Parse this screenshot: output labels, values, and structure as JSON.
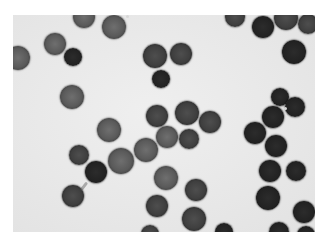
{
  "image": {
    "description": "Grayscale light micrograph of red blood cells on a pale background",
    "width": 328,
    "height": 245,
    "photo_region": {
      "x": 13,
      "y": 15,
      "w": 302,
      "h": 217
    },
    "colors": {
      "margin": "#ffffff",
      "background": "#e8e8e8",
      "cell_light": "#5a5a5a",
      "cell_mid": "#3f3f3f",
      "cell_dark": "#222222"
    }
  },
  "cells": [
    {
      "cx": 84,
      "cy": 17,
      "r": 11,
      "tone": "light"
    },
    {
      "cx": 114,
      "cy": 27,
      "r": 12,
      "tone": "light"
    },
    {
      "cx": 55,
      "cy": 44,
      "r": 11,
      "tone": "light"
    },
    {
      "cx": 73,
      "cy": 57,
      "r": 9,
      "tone": "dark"
    },
    {
      "cx": 18,
      "cy": 58,
      "r": 12,
      "tone": "light"
    },
    {
      "cx": 155,
      "cy": 56,
      "r": 12,
      "tone": "mid"
    },
    {
      "cx": 181,
      "cy": 54,
      "r": 11,
      "tone": "mid"
    },
    {
      "cx": 161,
      "cy": 79,
      "r": 9,
      "tone": "dark"
    },
    {
      "cx": 235,
      "cy": 17,
      "r": 10,
      "tone": "mid"
    },
    {
      "cx": 263,
      "cy": 27,
      "r": 11,
      "tone": "dark"
    },
    {
      "cx": 286,
      "cy": 18,
      "r": 12,
      "tone": "mid"
    },
    {
      "cx": 308,
      "cy": 24,
      "r": 10,
      "tone": "mid"
    },
    {
      "cx": 294,
      "cy": 52,
      "r": 12,
      "tone": "dark"
    },
    {
      "cx": 72,
      "cy": 97,
      "r": 12,
      "tone": "light"
    },
    {
      "cx": 157,
      "cy": 116,
      "r": 11,
      "tone": "mid"
    },
    {
      "cx": 187,
      "cy": 113,
      "r": 12,
      "tone": "mid"
    },
    {
      "cx": 210,
      "cy": 122,
      "r": 11,
      "tone": "mid"
    },
    {
      "cx": 167,
      "cy": 137,
      "r": 11,
      "tone": "light"
    },
    {
      "cx": 189,
      "cy": 139,
      "r": 10,
      "tone": "mid"
    },
    {
      "cx": 109,
      "cy": 130,
      "r": 12,
      "tone": "light"
    },
    {
      "cx": 146,
      "cy": 150,
      "r": 12,
      "tone": "light"
    },
    {
      "cx": 280,
      "cy": 97,
      "r": 9,
      "tone": "dark"
    },
    {
      "cx": 273,
      "cy": 117,
      "r": 11,
      "tone": "dark"
    },
    {
      "cx": 295,
      "cy": 107,
      "r": 10,
      "tone": "dark"
    },
    {
      "cx": 255,
      "cy": 133,
      "r": 11,
      "tone": "dark"
    },
    {
      "cx": 276,
      "cy": 146,
      "r": 11,
      "tone": "dark"
    },
    {
      "cx": 79,
      "cy": 155,
      "r": 10,
      "tone": "mid"
    },
    {
      "cx": 96,
      "cy": 172,
      "r": 11,
      "tone": "dark"
    },
    {
      "cx": 121,
      "cy": 161,
      "r": 13,
      "tone": "light"
    },
    {
      "cx": 73,
      "cy": 196,
      "r": 11,
      "tone": "mid"
    },
    {
      "cx": 166,
      "cy": 178,
      "r": 12,
      "tone": "light"
    },
    {
      "cx": 196,
      "cy": 190,
      "r": 11,
      "tone": "mid"
    },
    {
      "cx": 157,
      "cy": 206,
      "r": 11,
      "tone": "mid"
    },
    {
      "cx": 194,
      "cy": 219,
      "r": 12,
      "tone": "mid"
    },
    {
      "cx": 150,
      "cy": 234,
      "r": 9,
      "tone": "mid"
    },
    {
      "cx": 270,
      "cy": 171,
      "r": 11,
      "tone": "dark"
    },
    {
      "cx": 296,
      "cy": 171,
      "r": 10,
      "tone": "dark"
    },
    {
      "cx": 268,
      "cy": 198,
      "r": 12,
      "tone": "dark"
    },
    {
      "cx": 304,
      "cy": 212,
      "r": 11,
      "tone": "dark"
    },
    {
      "cx": 224,
      "cy": 232,
      "r": 9,
      "tone": "dark"
    },
    {
      "cx": 279,
      "cy": 232,
      "r": 10,
      "tone": "dark"
    },
    {
      "cx": 306,
      "cy": 235,
      "r": 9,
      "tone": "dark"
    }
  ],
  "artifacts": {
    "specks": [
      {
        "x": 284,
        "y": 107
      },
      {
        "x": 126,
        "y": 15
      }
    ],
    "strands": [
      {
        "x": 87,
        "y": 181,
        "angle": 128
      }
    ]
  }
}
